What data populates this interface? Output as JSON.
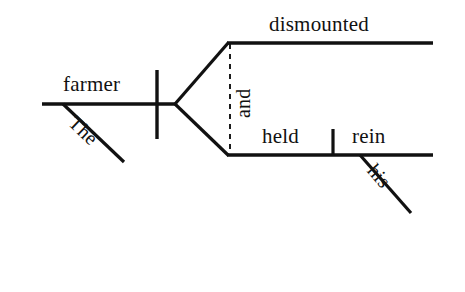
{
  "diagram": {
    "type": "reed-kellogg-sentence-diagram",
    "sentence": "The farmer dismounted and held his rein",
    "ink_color": "#111111",
    "background_color": "#ffffff",
    "words": {
      "subject": "farmer",
      "subject_article": "The",
      "predicate_one": "dismounted",
      "conjunction": "and",
      "predicate_two": "held",
      "direct_object": "rein",
      "object_modifier": "his"
    },
    "lines": {
      "main_baseline": {
        "x1": 42,
        "y1": 104,
        "x2": 176,
        "y2": 104
      },
      "subject_predicate_divider": {
        "x1": 157,
        "y1": 70,
        "x2": 157,
        "y2": 139
      },
      "article_modifier_diagonal": {
        "x1": 63,
        "y1": 104,
        "x2": 124,
        "y2": 162
      },
      "fork_upper_diagonal": {
        "x1": 175,
        "y1": 104,
        "x2": 228,
        "y2": 43
      },
      "fork_lower_diagonal": {
        "x1": 175,
        "y1": 104,
        "x2": 228,
        "y2": 155
      },
      "upper_predicate_baseline": {
        "x1": 227,
        "y1": 43,
        "x2": 433,
        "y2": 43
      },
      "lower_predicate_baseline": {
        "x1": 227,
        "y1": 155,
        "x2": 433,
        "y2": 155
      },
      "direct_object_divider": {
        "x1": 333,
        "y1": 130,
        "x2": 333,
        "y2": 156
      },
      "object_modifier_diagonal": {
        "x1": 360,
        "y1": 155,
        "x2": 411,
        "y2": 213
      },
      "conjunction_dashed_connector": {
        "x1": 230,
        "y1": 44,
        "x2": 230,
        "y2": 155,
        "dash": "5 5"
      }
    }
  }
}
